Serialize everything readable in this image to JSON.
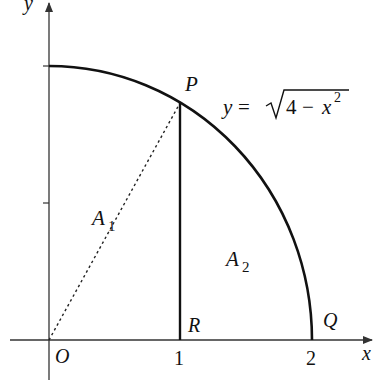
{
  "diagram": {
    "curve_label": "y = √(4 − x²)",
    "curve_label_parts": {
      "lhs": "y",
      "eq": "=",
      "radicand_const": "4",
      "minus": "−",
      "var": "x",
      "exp": "2"
    },
    "axes": {
      "x_label": "x",
      "y_label": "y",
      "x_ticks": [
        "1",
        "2"
      ],
      "y_ticks_unlabeled": [
        1,
        2
      ]
    },
    "points": {
      "O": {
        "label": "O",
        "x": 0,
        "y": 0
      },
      "P": {
        "label": "P",
        "x": 1,
        "y": 1.732
      },
      "R": {
        "label": "R",
        "x": 1,
        "y": 0
      },
      "Q": {
        "label": "Q",
        "x": 2,
        "y": 0
      }
    },
    "regions": {
      "A1": {
        "label": "A",
        "sub": "1"
      },
      "A2": {
        "label": "A",
        "sub": "2"
      }
    },
    "colors": {
      "stroke": "#111111",
      "axis": "#333333",
      "background": "#ffffff"
    }
  }
}
